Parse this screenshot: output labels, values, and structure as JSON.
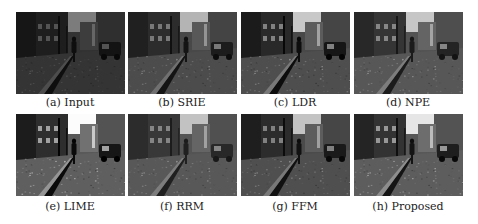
{
  "figure": {
    "panels": [
      {
        "id": "a",
        "caption": "(a) Input",
        "brightness": 0.55,
        "contrast": 1.0
      },
      {
        "id": "b",
        "caption": "(b) SRIE",
        "brightness": 0.8,
        "contrast": 1.0
      },
      {
        "id": "c",
        "caption": "(c) LDR",
        "brightness": 0.85,
        "contrast": 1.1
      },
      {
        "id": "d",
        "caption": "(d) NPE",
        "brightness": 0.9,
        "contrast": 0.95
      },
      {
        "id": "e",
        "caption": "(e) LIME",
        "brightness": 1.05,
        "contrast": 1.15
      },
      {
        "id": "f",
        "caption": "(f) RRM",
        "brightness": 0.9,
        "contrast": 0.9
      },
      {
        "id": "g",
        "caption": "(g) FFM",
        "brightness": 0.85,
        "contrast": 1.05
      },
      {
        "id": "h",
        "caption": "(h) Proposed",
        "brightness": 1.0,
        "contrast": 1.05
      }
    ]
  }
}
